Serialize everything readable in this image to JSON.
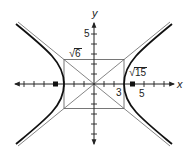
{
  "figure": {
    "type": "hyperbola-graph",
    "equation_params": {
      "a": 3,
      "b_label": "√6",
      "c_label": "√15"
    },
    "axes": {
      "x_label": "x",
      "y_label": "y",
      "x_tick_labels": [
        "3",
        "5"
      ],
      "y_tick_labels": [
        "5"
      ]
    },
    "annotations": {
      "b_value_radicand": "6",
      "c_value_radicand": "15",
      "radical_sign": "√"
    },
    "colors": {
      "curve": "#111111",
      "asymptote": "#555555",
      "axis": "#222222",
      "box": "#444444"
    }
  }
}
